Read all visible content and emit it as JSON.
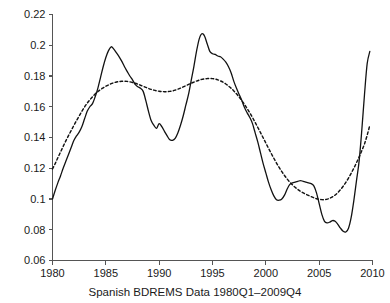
{
  "chart_data": {
    "type": "line",
    "title": "",
    "xlabel": "Spanish BDREMS Data 1980Q1–2009Q4",
    "ylabel": "",
    "xlim": [
      1980,
      2010
    ],
    "ylim": [
      0.06,
      0.22
    ],
    "grid": false,
    "legend": "none",
    "xticks": [
      "1980",
      "1985",
      "1990",
      "1995",
      "2000",
      "2005",
      "2010"
    ],
    "xtick_values": [
      1980,
      1985,
      1990,
      1995,
      2000,
      2005,
      2010
    ],
    "yticks": [
      "0.06",
      "0.08",
      "0.1",
      "0.12",
      "0.14",
      "0.16",
      "0.18",
      "0.2",
      "0.22"
    ],
    "ytick_values": [
      0.06,
      0.08,
      0.1,
      0.12,
      0.14,
      0.16,
      0.18,
      0.2,
      0.22
    ],
    "x": [
      1980.0,
      1980.25,
      1980.5,
      1980.75,
      1981.0,
      1981.25,
      1981.5,
      1981.75,
      1982.0,
      1982.25,
      1982.5,
      1982.75,
      1983.0,
      1983.25,
      1983.5,
      1983.75,
      1984.0,
      1984.25,
      1984.5,
      1984.75,
      1985.0,
      1985.25,
      1985.5,
      1985.75,
      1986.0,
      1986.25,
      1986.5,
      1986.75,
      1987.0,
      1987.25,
      1987.5,
      1987.75,
      1988.0,
      1988.25,
      1988.5,
      1988.75,
      1989.0,
      1989.25,
      1989.5,
      1989.75,
      1990.0,
      1990.25,
      1990.5,
      1990.75,
      1991.0,
      1991.25,
      1991.5,
      1991.75,
      1992.0,
      1992.25,
      1992.5,
      1992.75,
      1993.0,
      1993.25,
      1993.5,
      1993.75,
      1994.0,
      1994.25,
      1994.5,
      1994.75,
      1995.0,
      1995.25,
      1995.5,
      1995.75,
      1996.0,
      1996.25,
      1996.5,
      1996.75,
      1997.0,
      1997.25,
      1997.5,
      1997.75,
      1998.0,
      1998.25,
      1998.5,
      1998.75,
      1999.0,
      1999.25,
      1999.5,
      1999.75,
      2000.0,
      2000.25,
      2000.5,
      2000.75,
      2001.0,
      2001.25,
      2001.5,
      2001.75,
      2002.0,
      2002.25,
      2002.5,
      2002.75,
      2003.0,
      2003.25,
      2003.5,
      2003.75,
      2004.0,
      2004.25,
      2004.5,
      2004.75,
      2005.0,
      2005.25,
      2005.5,
      2005.75,
      2006.0,
      2006.25,
      2006.5,
      2006.75,
      2007.0,
      2007.25,
      2007.5,
      2007.75,
      2008.0,
      2008.25,
      2008.5,
      2008.75,
      2009.0,
      2009.25,
      2009.5,
      2009.75
    ],
    "series": [
      {
        "name": "observed",
        "style": "solid",
        "values": [
          0.1,
          0.1055,
          0.1105,
          0.115,
          0.12,
          0.1245,
          0.129,
          0.1335,
          0.138,
          0.141,
          0.1435,
          0.147,
          0.152,
          0.157,
          0.16,
          0.162,
          0.1665,
          0.172,
          0.179,
          0.186,
          0.192,
          0.1965,
          0.199,
          0.1975,
          0.195,
          0.1925,
          0.1895,
          0.186,
          0.183,
          0.18,
          0.1775,
          0.1745,
          0.173,
          0.172,
          0.17,
          0.164,
          0.157,
          0.151,
          0.148,
          0.146,
          0.149,
          0.147,
          0.144,
          0.141,
          0.1385,
          0.1382,
          0.1395,
          0.143,
          0.148,
          0.154,
          0.161,
          0.168,
          0.177,
          0.186,
          0.196,
          0.204,
          0.2075,
          0.206,
          0.201,
          0.196,
          0.1945,
          0.194,
          0.193,
          0.1925,
          0.191,
          0.189,
          0.186,
          0.182,
          0.1765,
          0.172,
          0.168,
          0.164,
          0.1595,
          0.156,
          0.153,
          0.149,
          0.143,
          0.137,
          0.13,
          0.123,
          0.117,
          0.111,
          0.106,
          0.102,
          0.0995,
          0.0992,
          0.1,
          0.1025,
          0.1065,
          0.1095,
          0.1105,
          0.111,
          0.1115,
          0.112,
          0.1115,
          0.111,
          0.1105,
          0.11,
          0.1085,
          0.104,
          0.097,
          0.09,
          0.0855,
          0.0845,
          0.085,
          0.086,
          0.0855,
          0.0835,
          0.081,
          0.079,
          0.0785,
          0.081,
          0.088,
          0.099,
          0.112,
          0.125,
          0.145,
          0.168,
          0.188,
          0.196
        ]
      },
      {
        "name": "trend",
        "style": "dashed",
        "values": [
          0.1195,
          0.123,
          0.1268,
          0.1305,
          0.1342,
          0.1378,
          0.1412,
          0.1445,
          0.1478,
          0.151,
          0.154,
          0.157,
          0.1598,
          0.1623,
          0.1645,
          0.1665,
          0.1683,
          0.1698,
          0.1712,
          0.1723,
          0.1733,
          0.1742,
          0.175,
          0.1756,
          0.1761,
          0.1764,
          0.1766,
          0.1766,
          0.1765,
          0.1762,
          0.1758,
          0.1753,
          0.1747,
          0.174,
          0.1733,
          0.1726,
          0.1719,
          0.1713,
          0.1708,
          0.1704,
          0.1701,
          0.1699,
          0.1698,
          0.1698,
          0.17,
          0.1703,
          0.1708,
          0.1714,
          0.1721,
          0.1729,
          0.1737,
          0.1745,
          0.1753,
          0.176,
          0.1767,
          0.1773,
          0.1778,
          0.1781,
          0.1783,
          0.1784,
          0.1783,
          0.178,
          0.1775,
          0.1768,
          0.1759,
          0.1748,
          0.1735,
          0.172,
          0.1703,
          0.1684,
          0.1663,
          0.164,
          0.1615,
          0.1588,
          0.156,
          0.153,
          0.1498,
          0.1465,
          0.1432,
          0.1398,
          0.1364,
          0.133,
          0.1297,
          0.1265,
          0.1234,
          0.1205,
          0.1178,
          0.1153,
          0.113,
          0.111,
          0.1092,
          0.1076,
          0.1062,
          0.105,
          0.104,
          0.1031,
          0.1023,
          0.1015,
          0.1008,
          0.1002,
          0.0998,
          0.0996,
          0.0996,
          0.0999,
          0.1005,
          0.1014,
          0.1026,
          0.1042,
          0.1061,
          0.1083,
          0.1108,
          0.1136,
          0.1167,
          0.12,
          0.1236,
          0.1274,
          0.1315,
          0.1358,
          0.1415,
          0.148
        ]
      }
    ]
  }
}
